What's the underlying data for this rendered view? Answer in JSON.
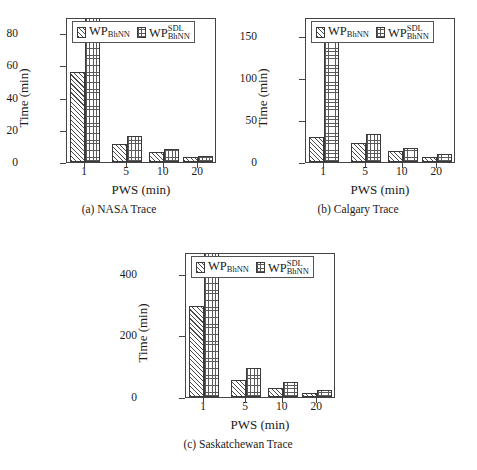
{
  "figure": {
    "legend": {
      "series1_pattern": "diagonal-hatch",
      "series2_pattern": "dotted-grid",
      "series1": {
        "base": "WP",
        "sub": "BhNN",
        "sup": ""
      },
      "series2": {
        "base": "WP",
        "sub": "BhNN",
        "sup": "SDL"
      }
    },
    "colors": {
      "line": "#444444",
      "hatch": "#4a4a4a",
      "dots": "#5a5a5a",
      "background": "#ffffff"
    },
    "panels": [
      {
        "id": "a",
        "caption_tag": "(a)",
        "caption_text": "NASA Trace"
      },
      {
        "id": "b",
        "caption_tag": "(b)",
        "caption_text": "Calgary Trace"
      },
      {
        "id": "c",
        "caption_tag": "(c)",
        "caption_text": "Saskatchewan Trace"
      }
    ]
  },
  "chart_data": [
    {
      "type": "bar",
      "title": "(a) NASA Trace",
      "xlabel": "PWS (min)",
      "ylabel": "Time (min)",
      "categories": [
        "1",
        "5",
        "10",
        "20"
      ],
      "x": [
        1,
        5,
        10,
        20
      ],
      "yticks": [
        0,
        20,
        40,
        60,
        80
      ],
      "ylim": [
        0,
        90
      ],
      "xtick_labels": [
        "1",
        "5",
        "10",
        "20"
      ],
      "grid": false,
      "legend_position": "upper-center",
      "series": [
        {
          "name": "WP_BhNN",
          "pattern": "diagonal-hatch",
          "values": [
            56,
            11,
            6,
            3
          ]
        },
        {
          "name": "WP^SDL_BhNN",
          "pattern": "dotted-grid",
          "values": [
            90,
            16,
            8,
            4
          ]
        }
      ],
      "notes": "Tallest dotted bar at PWS=1 is clipped by the axis top (exceeds 80)."
    },
    {
      "type": "bar",
      "title": "(b) Calgary Trace",
      "xlabel": "PWS (min)",
      "ylabel": "Time (min)",
      "categories": [
        "1",
        "5",
        "10",
        "20"
      ],
      "x": [
        1,
        5,
        10,
        20
      ],
      "yticks": [
        0,
        50,
        100,
        150
      ],
      "ylim": [
        0,
        172
      ],
      "xtick_labels": [
        "1",
        "5",
        "10",
        "20"
      ],
      "grid": false,
      "legend_position": "upper-center",
      "series": [
        {
          "name": "WP_BhNN",
          "pattern": "diagonal-hatch",
          "values": [
            30,
            22,
            13,
            6
          ]
        },
        {
          "name": "WP^SDL_BhNN",
          "pattern": "dotted-grid",
          "values": [
            156,
            33,
            17,
            10
          ]
        }
      ],
      "notes": "Tallest dotted bar at PWS=1 reaches about 156 min."
    },
    {
      "type": "bar",
      "title": "(c) Saskatchewan Trace",
      "xlabel": "PWS (min)",
      "ylabel": "Time (min)",
      "categories": [
        "1",
        "5",
        "10",
        "20"
      ],
      "x": [
        1,
        5,
        10,
        20
      ],
      "yticks": [
        0,
        200,
        400
      ],
      "ylim": [
        0,
        470
      ],
      "xtick_labels": [
        "1",
        "5",
        "10",
        "20"
      ],
      "grid": false,
      "legend_position": "upper-center",
      "series": [
        {
          "name": "WP_BhNN",
          "pattern": "diagonal-hatch",
          "values": [
            295,
            55,
            30,
            12
          ]
        },
        {
          "name": "WP^SDL_BhNN",
          "pattern": "dotted-grid",
          "values": [
            470,
            95,
            48,
            22
          ]
        }
      ],
      "notes": "Tallest dotted bar at PWS=1 is clipped by the axis top (exceeds 400)."
    }
  ]
}
